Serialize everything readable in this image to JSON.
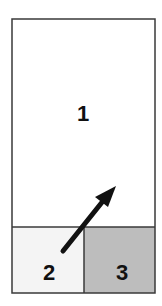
{
  "diagram": {
    "regions": [
      {
        "id": "1",
        "label": "1",
        "fill": "#ffffff"
      },
      {
        "id": "2",
        "label": "2",
        "fill": "#f4f4f4"
      },
      {
        "id": "3",
        "label": "3",
        "fill": "#bdbdbd"
      }
    ],
    "border_color": "#3a3a3a",
    "arrow": {
      "from_region": "2",
      "to_region": "1",
      "color": "#111111",
      "icon": "arrow-up-right-icon"
    }
  }
}
